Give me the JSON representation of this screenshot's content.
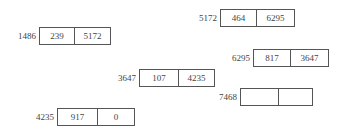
{
  "diagram": {
    "type": "linked-list-memory-layout",
    "nodes": [
      {
        "address": "1486",
        "data": "239",
        "next": "5172",
        "x": 39,
        "y": 27,
        "w": 72,
        "h": 18,
        "split": 34
      },
      {
        "address": "5172",
        "data": "464",
        "next": "6295",
        "x": 220,
        "y": 9,
        "w": 75,
        "h": 18,
        "split": 35
      },
      {
        "address": "6295",
        "data": "817",
        "next": "3647",
        "x": 253,
        "y": 49,
        "w": 76,
        "h": 18,
        "split": 36
      },
      {
        "address": "3647",
        "data": "107",
        "next": "4235",
        "x": 139,
        "y": 69,
        "w": 76,
        "h": 18,
        "split": 38
      },
      {
        "address": "7468",
        "data": "",
        "next": "",
        "x": 240,
        "y": 88,
        "w": 73,
        "h": 18,
        "split": 37
      },
      {
        "address": "4235",
        "data": "917",
        "next": "0",
        "x": 57,
        "y": 108,
        "w": 78,
        "h": 18,
        "split": 39
      }
    ]
  }
}
